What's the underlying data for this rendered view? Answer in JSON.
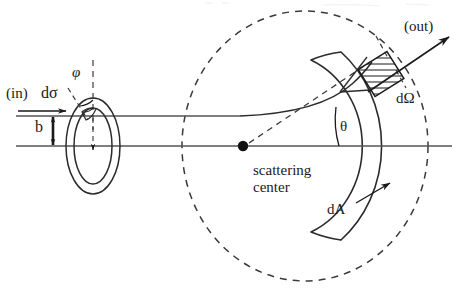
{
  "figure": {
    "type": "physics-diagram",
    "width": 458,
    "height": 290,
    "background_color": "#ffffff",
    "stroke_color": "#1a1a1a"
  },
  "labels": {
    "incoming": "(in)",
    "cross_section": "dσ",
    "azimuthal_angle": "φ",
    "impact_parameter": "b",
    "outgoing": "(out)",
    "solid_angle": "dΩ",
    "scattering_angle": "θ",
    "area_element": "dA",
    "scattering_center_line1": "scattering",
    "scattering_center_line2": "center"
  },
  "geometry": {
    "scattering_center": {
      "x": 243,
      "y": 146
    },
    "axis_line_y": 146,
    "upper_beam_line_y": 116,
    "impact_parameter_arrow": {
      "x": 53,
      "y_top": 116,
      "y_bottom": 146
    },
    "annulus": {
      "center_x": 93,
      "center_y": 146,
      "outer_rx": 27,
      "outer_ry": 48,
      "inner_rx": 19,
      "inner_ry": 38
    },
    "detector_sphere": {
      "center_x": 305,
      "center_y": 146,
      "rx": 123,
      "ry": 135,
      "dash": "7,6"
    },
    "detector_band": {
      "inner_rx": 86,
      "inner_ry": 94,
      "outer_rx": 112,
      "outer_ry": 122
    },
    "solid_angle_patch": {
      "x": 364,
      "y": 58,
      "w": 34,
      "h": 32,
      "rotation_deg": -32
    },
    "out_arrow": {
      "x1": 370,
      "y1": 90,
      "x2": 449,
      "y2": 36
    }
  },
  "colors": {
    "ink": "#1a1a1a",
    "line": "#2b2b2b",
    "dashed": "#3a3a3a",
    "background": "#ffffff"
  }
}
